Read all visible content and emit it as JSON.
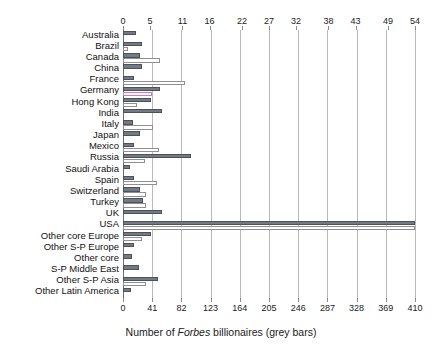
{
  "chart_data": {
    "type": "bar",
    "orientation": "horizontal",
    "title": "",
    "xlabel": "Number of Forbes billionaires (grey bars)",
    "ylabel": "",
    "grid": true,
    "legend_position": "none",
    "categories": [
      "Australia",
      "Brazil",
      "Canada",
      "China",
      "France",
      "Germany",
      "Hong Kong",
      "India",
      "Italy",
      "Japan",
      "Mexico",
      "Russia",
      "Saudi Arabia",
      "Spain",
      "Switzerland",
      "Turkey",
      "UK",
      "USA",
      "Other core Europe",
      "Other S-P Europe",
      "Other core",
      "S-P Middle East",
      "Other S-P Asia",
      "Other Latin America"
    ],
    "series": [
      {
        "name": "Number of Forbes billionaires (grey bars)",
        "axis": "bottom",
        "color": "#737a83",
        "values": [
          18,
          26,
          24,
          26,
          15,
          52,
          39,
          55,
          14,
          24,
          16,
          96,
          10,
          16,
          24,
          28,
          55,
          410,
          40,
          15,
          13,
          23,
          49,
          11
        ]
      },
      {
        "name": "White bars (top axis scale)",
        "axis": "top",
        "color": "#fdfdfd",
        "values": [
          0.0,
          1.0,
          6.8,
          0.0,
          11.5,
          5.3,
          2.6,
          0.0,
          5.5,
          0.0,
          6.6,
          4.1,
          0.0,
          6.2,
          4.3,
          4.3,
          0.0,
          54.0,
          3.6,
          0.0,
          0.0,
          0.0,
          4.2,
          0.0
        ]
      }
    ],
    "top_axis": {
      "ticks": [
        0,
        5,
        11,
        16,
        22,
        27,
        32,
        38,
        43,
        49,
        54
      ],
      "min": 0,
      "max": 54
    },
    "bottom_axis": {
      "ticks": [
        0,
        41,
        82,
        123,
        164,
        205,
        246,
        287,
        328,
        369,
        410
      ],
      "min": 0,
      "max": 410
    }
  },
  "axis_title_parts": {
    "prefix": "Number of ",
    "italic": "Forbes",
    "suffix": " billionaires (grey bars)"
  }
}
